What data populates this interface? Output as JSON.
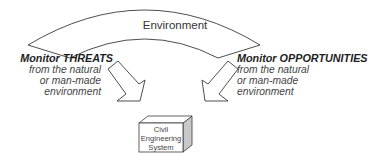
{
  "diagram": {
    "environment_label": "Environment",
    "left": {
      "title": "Monitor THREATS",
      "lines": [
        "from the natural",
        "or man-made",
        "environment"
      ]
    },
    "right": {
      "title": "Monitor OPPORTUNITIES",
      "lines": [
        "from the natural",
        "or man-made",
        "environment"
      ]
    },
    "system": {
      "lines": [
        "Civil",
        "Engineering",
        "System"
      ]
    },
    "colors": {
      "stroke": "#3a3a3a",
      "fill": "#ffffff",
      "box_side": "#c8c8c8",
      "text": "#2a2a2a"
    }
  }
}
